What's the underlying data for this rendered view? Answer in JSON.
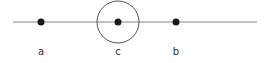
{
  "diagram": {
    "line": {
      "x1": 13,
      "x2": 257,
      "y": 22,
      "color": "#888888"
    },
    "points": [
      {
        "label": "a",
        "x": 41
      },
      {
        "label": "c",
        "x": 118
      },
      {
        "label": "b",
        "x": 176
      }
    ],
    "circle": {
      "center_label": "c",
      "cx": 118,
      "cy": 22,
      "r": 21,
      "color": "#555555"
    },
    "point_color": "#1a1a1a"
  }
}
